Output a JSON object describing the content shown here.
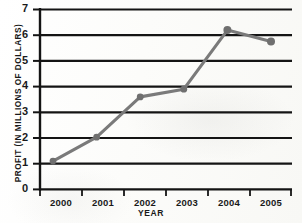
{
  "chart_data": {
    "type": "line",
    "title": "",
    "xlabel": "YEAR",
    "ylabel": "PROFIT (IN MILLIONS OF DOLLARS)",
    "categories": [
      "2000",
      "2001",
      "2002",
      "2003",
      "2004",
      "2005"
    ],
    "values": [
      1.1,
      2.03,
      3.6,
      3.9,
      6.2,
      5.75
    ],
    "series": [
      {
        "name": "Profit",
        "values": [
          1.1,
          2.03,
          3.6,
          3.9,
          6.2,
          5.75
        ]
      }
    ],
    "ylim": [
      0,
      7
    ],
    "yticks": [
      "0",
      "1",
      "2",
      "3",
      "4",
      "5",
      "6",
      "7"
    ],
    "xticks": [
      "2000",
      "2001",
      "2002",
      "2003",
      "2004",
      "2005"
    ],
    "grid": "horizontal",
    "legend": "none",
    "line_color": "#7a7a7a",
    "marker_color": "#6f6f6f",
    "axis_color": "#141414",
    "grid_color": "#141414",
    "marker": "circle"
  },
  "axis": {
    "y_title": "PROFIT (IN MILLIONS OF DOLLARS)",
    "x_title": "YEAR",
    "y_labels": [
      "7",
      "6",
      "5",
      "4",
      "3",
      "2",
      "1",
      "0"
    ],
    "x_labels": [
      "2000",
      "2001",
      "2002",
      "2003",
      "2004",
      "2005"
    ]
  }
}
